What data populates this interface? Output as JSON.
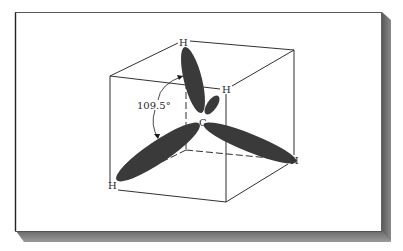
{
  "figure": {
    "angle_label": "109.5°",
    "center_atom": "C",
    "hydrogen_labels": [
      "H",
      "H",
      "H",
      "H"
    ],
    "colors": {
      "background": "#ffffff",
      "orbital_fill": "#3a3a3a",
      "line": "#1a1a1a",
      "shadow": "#6e6e6e"
    }
  }
}
